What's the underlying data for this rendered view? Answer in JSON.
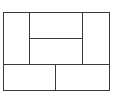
{
  "diagram": {
    "type": "layout-grid",
    "line_color": "#3a3a3a",
    "background": "#ffffff",
    "panels": [
      {
        "name": "left-panel"
      },
      {
        "name": "center-top-panel"
      },
      {
        "name": "center-bottom-panel"
      },
      {
        "name": "right-panel"
      },
      {
        "name": "bottom-left-panel"
      },
      {
        "name": "bottom-right-panel"
      }
    ]
  }
}
